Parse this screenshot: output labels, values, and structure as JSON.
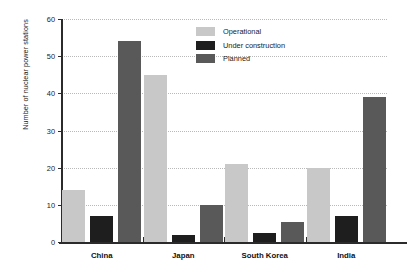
{
  "chart_data": {
    "type": "bar",
    "title": "",
    "subtitle": "",
    "xlabel": "",
    "ylabel": "Number of nuclear power stations",
    "categories": [
      "China",
      "Japan",
      "South Korea",
      "India"
    ],
    "series": [
      {
        "name": "Operational",
        "color": "#c8c8c8",
        "values": [
          14,
          45,
          21,
          20
        ]
      },
      {
        "name": "Under construction",
        "color": "#1e1e1e",
        "values": [
          7,
          2,
          2.5,
          7
        ]
      },
      {
        "name": "Planned",
        "color": "#595959",
        "values": [
          54,
          10,
          5.5,
          39
        ]
      }
    ],
    "ylim": [
      0,
      60
    ],
    "yticks": [
      0,
      10,
      20,
      30,
      40,
      50,
      60
    ],
    "ytick_labels": [
      "0",
      "10",
      "20",
      "30",
      "40",
      "50",
      "60"
    ],
    "grid": "horizontal-dotted",
    "legend_position": "top-right-inside",
    "background_color": "#ffffff",
    "axis_color": "#2b2b2b",
    "gridline_color": "#b9b9b9"
  }
}
